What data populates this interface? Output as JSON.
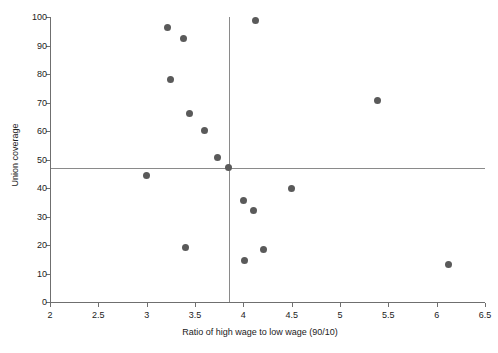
{
  "chart_data": {
    "type": "scatter",
    "title": "",
    "xlabel": "Ratio of high wage to low wage (90/10)",
    "ylabel": "Union coverage",
    "xlim": [
      2,
      6.5
    ],
    "ylim": [
      0,
      100
    ],
    "xticks": [
      2,
      2.5,
      3,
      3.5,
      4,
      4.5,
      5,
      5.5,
      6,
      6.5
    ],
    "xticklabels": [
      "2",
      "2.5",
      "3",
      "3.5",
      "4",
      "4.5",
      "5",
      "5.5",
      "6",
      "6.5"
    ],
    "yticks": [
      0,
      10,
      20,
      30,
      40,
      50,
      60,
      70,
      80,
      90,
      100
    ],
    "yticklabels": [
      "0",
      "10",
      "20",
      "30",
      "40",
      "50",
      "60",
      "70",
      "80",
      "90",
      "100"
    ],
    "grid": false,
    "legend": null,
    "marker": {
      "shape": "circle",
      "color": "#5a5a5a",
      "size_px": 7
    },
    "reference_lines": [
      {
        "orientation": "vertical",
        "value": 3.85,
        "color": "#8a8a8a"
      },
      {
        "orientation": "horizontal",
        "value": 47.0,
        "color": "#8a8a8a"
      }
    ],
    "points": [
      {
        "x": 3.0,
        "y": 44.5
      },
      {
        "x": 3.22,
        "y": 96.3
      },
      {
        "x": 3.25,
        "y": 78.0
      },
      {
        "x": 3.38,
        "y": 92.3
      },
      {
        "x": 3.4,
        "y": 19.1
      },
      {
        "x": 3.44,
        "y": 66.2
      },
      {
        "x": 3.6,
        "y": 60.2
      },
      {
        "x": 3.73,
        "y": 50.6
      },
      {
        "x": 3.85,
        "y": 47.2
      },
      {
        "x": 4.0,
        "y": 35.7
      },
      {
        "x": 4.01,
        "y": 14.7
      },
      {
        "x": 4.1,
        "y": 32.0
      },
      {
        "x": 4.13,
        "y": 98.6
      },
      {
        "x": 4.21,
        "y": 18.5
      },
      {
        "x": 4.5,
        "y": 40.0
      },
      {
        "x": 5.39,
        "y": 70.6
      },
      {
        "x": 6.12,
        "y": 13.2
      }
    ]
  },
  "axes": {
    "x_axis_label": "Ratio of high wage to low wage (90/10)",
    "y_axis_label": "Union coverage"
  }
}
